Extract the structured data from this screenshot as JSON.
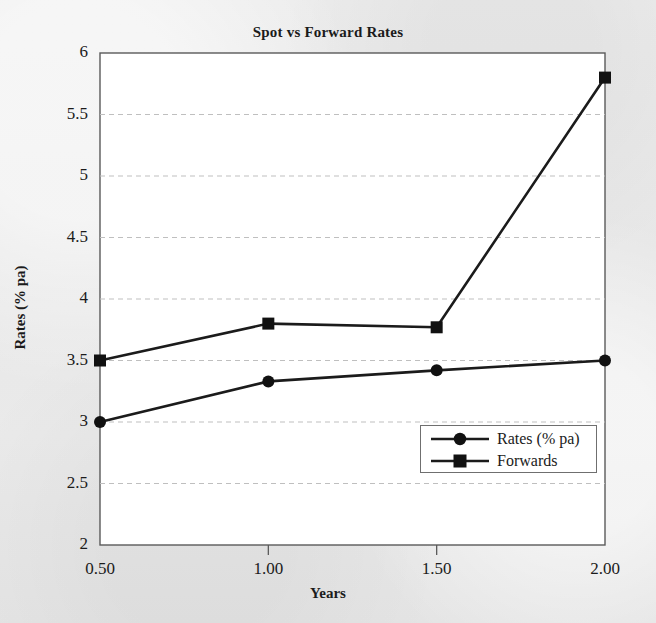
{
  "chart_data": {
    "type": "line",
    "title": "Spot vs Forward Rates",
    "xlabel": "Years",
    "ylabel": "Rates (% pa)",
    "x": [
      0.5,
      1.0,
      1.5,
      2.0
    ],
    "xtick_labels": [
      "0.50",
      "1.00",
      "1.50",
      "2.00"
    ],
    "xlim": [
      0.5,
      2.0
    ],
    "ylim": [
      2,
      6
    ],
    "ytick_labels": [
      "2",
      "2.5",
      "3",
      "3.5",
      "4",
      "4.5",
      "5",
      "5.5",
      "6"
    ],
    "ytick_values": [
      2,
      2.5,
      3,
      3.5,
      4,
      4.5,
      5,
      5.5,
      6
    ],
    "grid": "horizontal-dashed",
    "legend_position": "lower-right-inside",
    "series": [
      {
        "name": "Rates (% pa)",
        "marker": "circle",
        "values": [
          3.0,
          3.33,
          3.42,
          3.5
        ]
      },
      {
        "name": "Forwards",
        "marker": "square",
        "values": [
          3.5,
          3.8,
          3.77,
          5.8
        ]
      }
    ]
  },
  "legend": {
    "entries": [
      {
        "label": "Rates (% pa)",
        "marker": "circle-marker-icon"
      },
      {
        "label": "Forwards",
        "marker": "square-marker-icon"
      }
    ]
  },
  "colors": {
    "line": "#1b1b1b",
    "marker": "#111111",
    "grid": "#bfbfbf",
    "axis": "#5a5a5a",
    "plot_background": "#ffffff",
    "page_background": "#e9e9e9"
  }
}
